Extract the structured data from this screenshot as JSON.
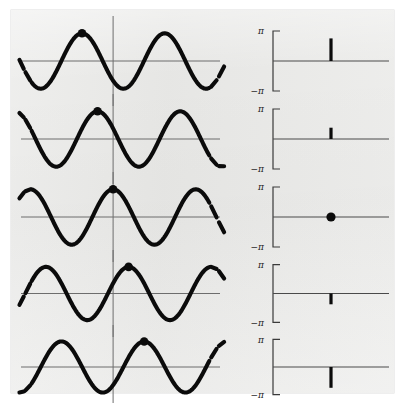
{
  "figure": {
    "caption_absent": true,
    "background_color": "#ffffff",
    "panel_color": "#e9e9e7",
    "curve_color": "#0b0b0b",
    "axis_color": "#6d6d6d",
    "rows": 5
  },
  "chart_data": {
    "type": "line",
    "title": "",
    "subtitle": "",
    "layout": {
      "rows": 5,
      "columns": 2,
      "left_column_name": "waveform",
      "right_column_name": "phase",
      "grid": false,
      "legend": "none"
    },
    "waveform_panels": {
      "xlabel": "",
      "ylabel": "",
      "amplitude": 1.0,
      "cycles_shown": 2.6,
      "xlim": [
        -1.35,
        1.55
      ],
      "ylim": [
        -1.45,
        1.45
      ],
      "zero_line": true,
      "vertical_axis_line": true,
      "continuation_dashes": [
        "left",
        "right"
      ],
      "marker": "filled-circle-at-nearest-peak"
    },
    "phase_panels": {
      "ylabel": "",
      "ytick_labels": [
        "π",
        "−π"
      ],
      "ytick_values": [
        3.14159,
        -3.14159
      ],
      "ylim": [
        -3.14159,
        3.14159
      ],
      "zero_line": true,
      "stem_x_position": 0.5,
      "axis_style": "bracket"
    },
    "series": [
      {
        "name": "row-1",
        "index": 1,
        "phase": 2.36,
        "phase_label": "3π/4",
        "peak_offset_normalized": -0.375,
        "phase_marker": "stem-up",
        "stem_height_fraction": 0.75
      },
      {
        "name": "row-2",
        "index": 2,
        "phase": 1.18,
        "phase_label": "3π/8",
        "peak_offset_normalized": -0.19,
        "phase_marker": "stem-up",
        "stem_height_fraction": 0.375
      },
      {
        "name": "row-3",
        "index": 3,
        "phase": 0.0,
        "phase_label": "0",
        "peak_offset_normalized": 0.0,
        "phase_marker": "dot",
        "stem_height_fraction": 0.0
      },
      {
        "name": "row-4",
        "index": 4,
        "phase": -1.18,
        "phase_label": "−3π/8",
        "peak_offset_normalized": 0.19,
        "phase_marker": "stem-down",
        "stem_height_fraction": 0.375
      },
      {
        "name": "row-5",
        "index": 5,
        "phase": -2.36,
        "phase_label": "−3π/4",
        "peak_offset_normalized": 0.375,
        "phase_marker": "stem-down",
        "stem_height_fraction": 0.75
      }
    ]
  },
  "labels": {
    "pi": "π",
    "neg_pi": "−π"
  }
}
